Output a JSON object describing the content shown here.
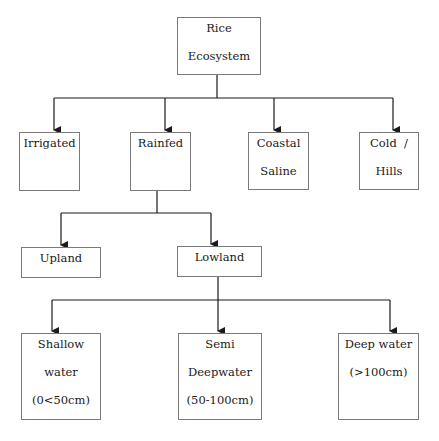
{
  "diagram": {
    "title": "Rice Ecosystem",
    "root": {
      "lines": [
        "Rice",
        "Ecosystem"
      ]
    },
    "level1": [
      {
        "id": "irrigated",
        "lines": [
          "Irrigated"
        ]
      },
      {
        "id": "rainfed",
        "lines": [
          "Rainfed"
        ]
      },
      {
        "id": "coastal-saline",
        "lines": [
          "Coastal",
          "Saline"
        ]
      },
      {
        "id": "cold-hills",
        "lines": [
          "Cold  /",
          "Hills"
        ]
      }
    ],
    "level2": [
      {
        "id": "upland",
        "lines": [
          "Upland"
        ]
      },
      {
        "id": "lowland",
        "lines": [
          "Lowland"
        ]
      }
    ],
    "level3": [
      {
        "id": "shallow-water",
        "lines": [
          "Shallow",
          "water",
          "(0<50cm)"
        ]
      },
      {
        "id": "semi-deepwater",
        "lines": [
          "Semi",
          "Deepwater",
          "(50-100cm)"
        ]
      },
      {
        "id": "deep-water",
        "lines": [
          "Deep water",
          "(>100cm)"
        ]
      }
    ],
    "edges": [
      [
        "Rice Ecosystem",
        "Irrigated"
      ],
      [
        "Rice Ecosystem",
        "Rainfed"
      ],
      [
        "Rice Ecosystem",
        "Coastal Saline"
      ],
      [
        "Rice Ecosystem",
        "Cold / Hills"
      ],
      [
        "Rainfed",
        "Upland"
      ],
      [
        "Rainfed",
        "Lowland"
      ],
      [
        "Lowland",
        "Shallow water (0<50cm)"
      ],
      [
        "Lowland",
        "Semi Deepwater (50-100cm)"
      ],
      [
        "Lowland",
        "Deep water (>100cm)"
      ]
    ],
    "colors": {
      "line": "#1a1a1a",
      "box_border": "#7a7a7a",
      "text": "#1a1a1a",
      "background": "#ffffff"
    }
  }
}
